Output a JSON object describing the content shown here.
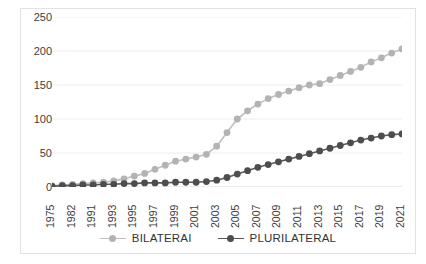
{
  "chart_data": {
    "type": "line",
    "title": "",
    "subtitle": "",
    "xlabel": "",
    "ylabel": "",
    "ylim": [
      0,
      250
    ],
    "yticks": [
      0,
      50,
      100,
      150,
      200,
      250
    ],
    "grid": true,
    "legend_position": "bottom",
    "x_tick_labels": [
      "1975",
      "1982",
      "1991",
      "1993",
      "1995",
      "1997",
      "1999",
      "2001",
      "2003",
      "2005",
      "2007",
      "2009",
      "2011",
      "2013",
      "2015",
      "2017",
      "2019",
      "2021"
    ],
    "x": [
      "1975",
      "1980",
      "1982",
      "1988",
      "1991",
      "1992",
      "1993",
      "1994",
      "1995",
      "1996",
      "1997",
      "1998",
      "1999",
      "2000",
      "2001",
      "2002",
      "2003",
      "2004",
      "2005",
      "2006",
      "2007",
      "2008",
      "2009",
      "2010",
      "2011",
      "2012",
      "2013",
      "2014",
      "2015",
      "2016",
      "2017",
      "2018",
      "2019",
      "2020",
      "2021"
    ],
    "series": [
      {
        "name": "BILATERAI",
        "color": "#bfbfbf",
        "marker_color": "#b3b3b3",
        "values": [
          2,
          3,
          4,
          5,
          6,
          7,
          9,
          12,
          16,
          20,
          26,
          32,
          38,
          41,
          44,
          48,
          60,
          80,
          100,
          112,
          122,
          130,
          136,
          141,
          146,
          150,
          152,
          158,
          164,
          170,
          176,
          184,
          190,
          197,
          203
        ]
      },
      {
        "name": "PLURILATERAL",
        "color": "#595959",
        "marker_color": "#4d4d4d",
        "values": [
          1,
          2,
          2,
          3,
          3,
          4,
          4,
          5,
          5,
          6,
          6,
          6,
          7,
          7,
          7,
          8,
          10,
          14,
          19,
          24,
          29,
          33,
          37,
          41,
          45,
          49,
          53,
          57,
          61,
          65,
          69,
          72,
          75,
          77,
          78
        ]
      }
    ]
  },
  "legend": {
    "items": [
      {
        "label": "BILATERAI"
      },
      {
        "label": "PLURILATERAL"
      }
    ]
  }
}
